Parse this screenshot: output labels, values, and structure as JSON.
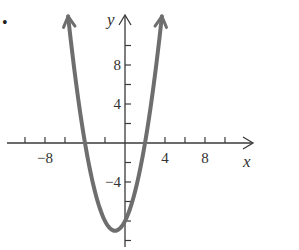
{
  "chart_data": {
    "type": "line",
    "title": "",
    "xlabel": "x",
    "ylabel": "y",
    "function": "y = x^2 + 2x - 8",
    "x_ticks": [
      -10,
      -8,
      -6,
      -4,
      -2,
      0,
      2,
      4,
      6,
      8,
      10
    ],
    "x_tick_labels": [
      {
        "value": -8,
        "label": "−8"
      },
      {
        "value": 4,
        "label": "4"
      },
      {
        "value": 8,
        "label": "8"
      }
    ],
    "y_ticks": [
      -10,
      -8,
      -6,
      -4,
      -2,
      2,
      4,
      6,
      8,
      10
    ],
    "y_tick_labels": [
      {
        "value": 8,
        "label": "8"
      },
      {
        "value": 4,
        "label": "4"
      },
      {
        "value": -4,
        "label": "−4"
      }
    ],
    "xlim": [
      -12,
      13
    ],
    "ylim": [
      -10.5,
      13
    ],
    "grid": false,
    "series": [
      {
        "name": "parabola",
        "color": "#6e6e6e",
        "x_intercepts": [
          -4,
          2
        ],
        "y_intercept": -8,
        "vertex": [
          -1,
          -9
        ],
        "arrow_ends": true,
        "x": [
          -5.69,
          -5,
          -4,
          -3,
          -2,
          -1,
          0,
          1,
          2,
          3,
          3.69
        ],
        "y": [
          13,
          7,
          0,
          -5,
          -8,
          -9,
          -8,
          -5,
          0,
          7,
          13
        ]
      }
    ]
  },
  "marker": {
    "bullet": "•"
  }
}
